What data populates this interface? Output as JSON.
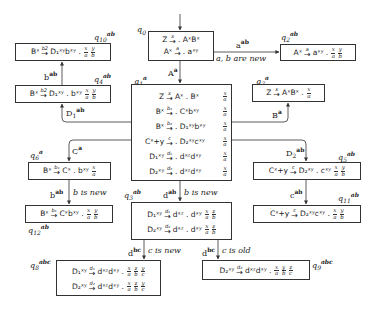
{
  "diagram": {
    "type": "LR automaton / state graph",
    "states": {
      "q0": {
        "label": "q",
        "sub": "0",
        "sup": "",
        "rules": [
          {
            "lhs": "Z",
            "arrow": "x",
            "rhs": ". AˣBˣ"
          },
          {
            "lhs": "Aˣ",
            "arrow": "a",
            "rhs": ". aˣʸ"
          }
        ],
        "fracs": []
      },
      "q1": {
        "label": "q",
        "sub": "1",
        "sup": "a",
        "rules": [
          {
            "lhs": "Z",
            "arrow": "x",
            "rhs": "Aˣ . Bˣ",
            "frac": "x/a"
          },
          {
            "lhs": "Bˣ",
            "arrow": "b1",
            "rhs": ". Cˣbˣʸ",
            "frac": "x/a"
          },
          {
            "lhs": "Bˣ",
            "arrow": "b2",
            "rhs": ". D₁ˣʸbˣʸ",
            "frac": "x/a"
          },
          {
            "lhs": "Cˣ+y",
            "arrow": "c",
            "rhs": ". D₂ˣʸcˣʸ",
            "frac": "x/a"
          },
          {
            "lhs": "D₁ˣʸ",
            "arrow": "d1",
            "rhs": ". dˣᶻdˣʸ",
            "frac": "x/a"
          },
          {
            "lhs": "D₂ˣʸ",
            "arrow": "d2",
            "rhs": ". dˣᶻdˣʸ",
            "frac": "x/a"
          }
        ]
      },
      "q2": {
        "label": "q",
        "sub": "2",
        "sup": "ab",
        "rules": [
          {
            "lhs": "Aˣ",
            "arrow": "a",
            "rhs": "aˣʸ .",
            "frac": "x/a y/b"
          }
        ]
      },
      "q3": {
        "label": "q",
        "sub": "3",
        "sup": "ab",
        "rules": [
          {
            "lhs": "D₁ˣʸ",
            "arrow": "d1",
            "rhs": "dˣᶻ . dˣʸ",
            "frac": "x/a z/b"
          },
          {
            "lhs": "D₂ˣʸ",
            "arrow": "d2",
            "rhs": "dˣᶻ . dˣʸ",
            "frac": "x/a z/b"
          }
        ]
      },
      "q4": {
        "label": "q",
        "sub": "4",
        "sup": "ab",
        "rules": [
          {
            "lhs": "Bˣ",
            "arrow": "b2",
            "rhs": "D₁ˣʸ . bˣʸ",
            "frac": "x/a y/b"
          }
        ]
      },
      "q5": {
        "label": "q",
        "sub": "5",
        "sup": "ab",
        "rules": [
          {
            "lhs": "Cˣ+y",
            "arrow": "c",
            "rhs": "D₂ˣʸ . cˣʸ",
            "frac": "x/a y/b"
          }
        ]
      },
      "q6": {
        "label": "q",
        "sub": "6",
        "sup": "a",
        "rules": [
          {
            "lhs": "Bˣ",
            "arrow": "b1",
            "rhs": "Cˣ . bˣʸ",
            "frac": "x/a"
          }
        ]
      },
      "q7": {
        "label": "q",
        "sub": "7",
        "sup": "a",
        "rules": [
          {
            "lhs": "Z",
            "arrow": "x",
            "rhs": "AˣBˣ .",
            "frac": "x/a"
          }
        ]
      },
      "q8": {
        "label": "q",
        "sub": "8",
        "sup": "abc",
        "rules": [
          {
            "lhs": "D₁ˣʸ",
            "arrow": "d1",
            "rhs": "dˣᶻdˣʸ .",
            "frac": "x/a z/b y/c"
          },
          {
            "lhs": "D₂ˣʸ",
            "arrow": "d2",
            "rhs": "dˣᶻdˣʸ .",
            "frac": "x/a z/b y/c"
          }
        ]
      },
      "q9": {
        "label": "q",
        "sub": "9",
        "sup": "abc",
        "rules": [
          {
            "lhs": "D₂ˣʸ",
            "arrow": "d2",
            "rhs": "dˣᶻdˣʸ .",
            "frac": "x/a y/b z/c"
          }
        ]
      },
      "q10": {
        "label": "q",
        "sub": "10",
        "sup": "ab",
        "rules": [
          {
            "lhs": "Bˣ",
            "arrow": "b2",
            "rhs": "D₁ˣʸbˣʸ .",
            "frac": "x/a y/b"
          }
        ]
      },
      "q11": {
        "label": "q",
        "sub": "11",
        "sup": "ab",
        "rules": [
          {
            "lhs": "Cˣ+y",
            "arrow": "c",
            "rhs": "D₂ˣʸcˣʸ .",
            "frac": "x/a y/b"
          }
        ]
      },
      "q12": {
        "label": "q",
        "sub": "12",
        "sup": "ab",
        "rules": [
          {
            "lhs": "Bˣ",
            "arrow": "b1",
            "rhs": "Cˣbˣʸ .",
            "frac": "x/a y/b"
          }
        ]
      }
    },
    "edges": [
      {
        "from": "start",
        "to": "q0",
        "label": ""
      },
      {
        "from": "q0",
        "to": "q1",
        "symbol": "A",
        "sup": "a",
        "note": ""
      },
      {
        "from": "q0",
        "to": "q2",
        "symbol": "a",
        "sup": "ab",
        "note": "a, b are new"
      },
      {
        "from": "q1",
        "to": "q7",
        "symbol": "B",
        "sup": "a",
        "note": ""
      },
      {
        "from": "q1",
        "to": "q4",
        "symbol": "D",
        "sub": "1",
        "sup": "ab",
        "note": ""
      },
      {
        "from": "q4",
        "to": "q10",
        "symbol": "b",
        "sup": "ab",
        "note": ""
      },
      {
        "from": "q1",
        "to": "q6",
        "symbol": "C",
        "sup": "a",
        "note": ""
      },
      {
        "from": "q6",
        "to": "q12",
        "symbol": "b",
        "sup": "ab",
        "note": "b is new"
      },
      {
        "from": "q1",
        "to": "q5",
        "symbol": "D",
        "sub": "2",
        "sup": "ab",
        "note": ""
      },
      {
        "from": "q5",
        "to": "q11",
        "symbol": "c",
        "sup": "ab",
        "note": ""
      },
      {
        "from": "q1",
        "to": "q3",
        "symbol": "d",
        "sup": "ab",
        "note": "b is new"
      },
      {
        "from": "q3",
        "to": "q8",
        "symbol": "d",
        "sup": "bc",
        "note": "c is new"
      },
      {
        "from": "q3",
        "to": "q9",
        "symbol": "d",
        "sup": "bc",
        "note": "c is old"
      }
    ]
  },
  "text": {
    "q0_r1_lhs": "Z",
    "q0_r1_arr": "x",
    "q0_r1_rhs": ". AˣBˣ",
    "q0_r2_lhs": "Aˣ",
    "q0_r2_arr": "a",
    "q0_r2_rhs": ". aˣʸ",
    "e_q0_q2_sym": "a",
    "e_q0_q2_sup": "ab",
    "e_q0_q2_note": "a, b are new",
    "e_q0_q1_sym": "A",
    "e_q0_q1_sup": "a",
    "e_q1_q7_sym": "B",
    "e_q1_q7_sup": "a",
    "e_q1_q4_sym": "D",
    "e_q1_q4_sub": "1",
    "e_q1_q4_sup": "ab",
    "e_q4_q10_sym": "b",
    "e_q4_q10_sup": "ab",
    "e_q1_q6_sym": "C",
    "e_q1_q6_sup": "a",
    "e_q6_q12_sym": "b",
    "e_q6_q12_sup": "ab",
    "e_q6_q12_note": "b is new",
    "e_q1_q5_sym": "D",
    "e_q1_q5_sub": "2",
    "e_q1_q5_sup": "ab",
    "e_q5_q11_sym": "c",
    "e_q5_q11_sup": "ab",
    "e_q1_q3_sym": "d",
    "e_q1_q3_sup": "ab",
    "e_q1_q3_note": "b is new",
    "e_q3_q8_sym": "d",
    "e_q3_q8_sup": "bc",
    "e_q3_q8_note": "c is new",
    "e_q3_q9_sym": "d",
    "e_q3_q9_sup": "bc",
    "e_q3_q9_note": "c is old"
  },
  "colors": {
    "line": "#333333",
    "text": "#1a1a1a",
    "background": "#ffffff"
  }
}
